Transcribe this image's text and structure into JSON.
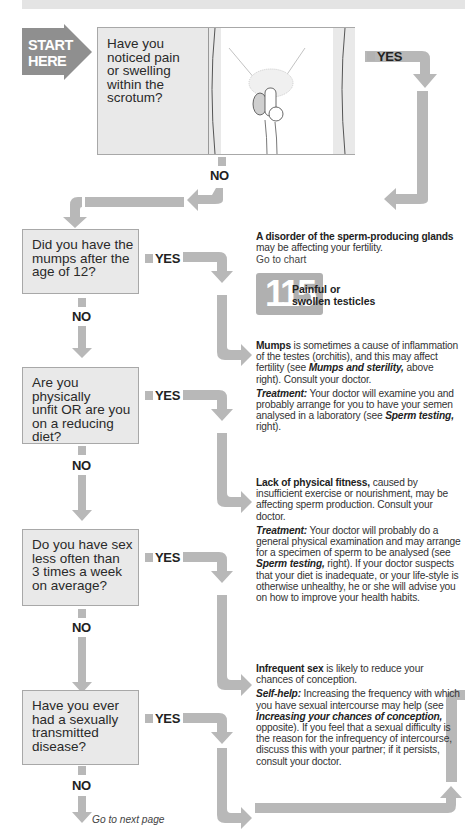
{
  "header": {
    "bar": ""
  },
  "start": {
    "label_line1": "START",
    "label_line2": "HERE"
  },
  "questions": [
    {
      "id": "q1",
      "text": "Have you noticed pain or swelling within the scrotum?",
      "lines": [
        "Have you",
        "noticed pain",
        "or swelling",
        "within the",
        "scrotum?"
      ],
      "yes": "YES",
      "no": "NO"
    },
    {
      "id": "q2",
      "text": "Did you have the mumps after the age of 12?",
      "lines": [
        "Did you have the",
        "mumps after the",
        "age of 12?"
      ],
      "yes": "YES",
      "no": "NO"
    },
    {
      "id": "q3",
      "text": "Are you physically unfit OR are you on a reducing diet?",
      "lines": [
        "Are you physically",
        "unfit OR are you",
        "on a reducing",
        "diet?"
      ],
      "yes": "YES",
      "no": "NO"
    },
    {
      "id": "q4",
      "text": "Do you have sex less often than 3 times a week on average?",
      "lines": [
        "Do you have sex",
        "less often than",
        "3 times a week",
        "on average?"
      ],
      "yes": "YES",
      "no": "NO"
    },
    {
      "id": "q5",
      "text": "Have you ever had a sexually transmitted disease?",
      "lines": [
        "Have you ever",
        "had a sexually",
        "transmitted",
        "disease?"
      ],
      "yes": "YES",
      "no": "NO"
    }
  ],
  "answers": {
    "a1": {
      "bold": "A disorder of the sperm-producing glands",
      "rest": " may be affecting your fertility.",
      "goto": "Go to chart",
      "chart_number": "115",
      "chart_title_line1": "Painful or",
      "chart_title_line2": "swollen testicles"
    },
    "a2": {
      "bold": "Mumps",
      "rest": " is sometimes a cause of inflammation of the testes (orchitis), and this may affect fertility (see ",
      "ref": "Mumps and sterility,",
      "rest2": " above right). Consult your doctor.",
      "treat_label": "Treatment:",
      "treat": " Your doctor will examine you and probably arrange for you to have your semen analysed in a laboratory (see ",
      "treat_ref": "Sperm testing,",
      "treat_end": " right)."
    },
    "a3": {
      "bold": "Lack of physical fitness,",
      "rest": " caused by insufficient exercise or nourishment, may be affecting sperm production. Consult your doctor.",
      "treat_label": "Treatment:",
      "treat": " Your doctor will probably do a general physical examination and may arrange for a specimen of sperm to be analysed (see ",
      "treat_ref": "Sperm testing,",
      "treat_end": " right). If your doctor suspects that your diet is inadequate, or your life-style is otherwise unhealthy, he or she will advise you on how to improve your health habits."
    },
    "a4": {
      "bold": "Infrequent sex",
      "rest": " is likely to reduce your chances of conception.",
      "help_label": "Self-help:",
      "help": " Increasing the frequency with which you have sexual intercourse may help (see ",
      "help_ref": "Increasing your chances of conception,",
      "help_end": " opposite). If you feel that a sexual difficulty is the reason for the infrequency of intercourse, discuss this with your partner; if it persists, consult your doctor."
    }
  },
  "footer": {
    "next": "Go to next page"
  },
  "colors": {
    "arrow": "#b5b5b5",
    "box": "#e9e9e9",
    "start": "#8f8f8f",
    "text": "#222222"
  }
}
